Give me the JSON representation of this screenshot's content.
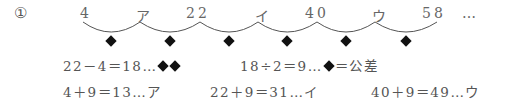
{
  "problem": {
    "marker": "①",
    "sequence": [
      "4",
      "ア",
      "22",
      "イ",
      "40",
      "ウ",
      "58",
      "…"
    ],
    "diamond_count": 6,
    "line1": {
      "expr1": "22－4＝18…",
      "expr1_suffix_diamonds": 2,
      "expr2": "18÷2＝9…",
      "expr2_after": "＝公差"
    },
    "line2": {
      "expr1": "4＋9＝13…ア",
      "expr2": "22＋9＝31…イ",
      "expr3": "40＋9＝49…ウ"
    }
  }
}
